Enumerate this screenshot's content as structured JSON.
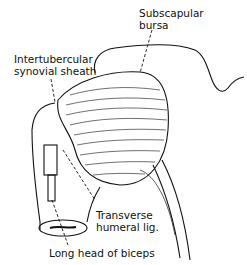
{
  "diagram": {
    "labels": {
      "subscapular_bursa": [
        "Subscapular",
        "bursa"
      ],
      "intertubercular_sheath": [
        "Intertubercular",
        "synovial sheath"
      ],
      "transverse_humeral": [
        "Transverse",
        "humeral lig."
      ],
      "long_head_biceps": [
        "Long head of biceps"
      ]
    }
  }
}
